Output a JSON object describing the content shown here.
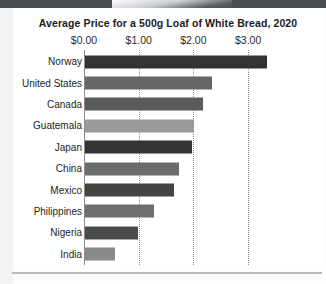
{
  "chart_data": {
    "type": "bar",
    "orientation": "horizontal",
    "title": "Average Price for a 500g Loaf of White Bread, 2020",
    "xlabel": "",
    "ylabel": "",
    "categories": [
      "Norway",
      "United States",
      "Canada",
      "Guatemala",
      "Japan",
      "China",
      "Mexico",
      "Philippines",
      "Nigeria",
      "India"
    ],
    "values": [
      3.33,
      2.33,
      2.16,
      2.0,
      1.95,
      1.71,
      1.62,
      1.27,
      0.97,
      0.55
    ],
    "bar_colors": [
      "#333333",
      "#666666",
      "#5a5a5a",
      "#9a9a9a",
      "#333333",
      "#6b6b6b",
      "#444444",
      "#6e6e6e",
      "#4a4a4a",
      "#8a8a8a"
    ],
    "xlim": [
      0,
      3.6
    ],
    "xticks": [
      0,
      1,
      2,
      3
    ],
    "xtick_labels": [
      "$0.00",
      "$1.00",
      "$2.00",
      "$3.00"
    ],
    "grid": "dotted-vertical",
    "legend": null,
    "tick_label_position": "top"
  },
  "colors": {
    "background": "#ffffff",
    "page_background": "#fdfdfd",
    "top_band": "#4a4d52",
    "gridline": "#8f8f8f",
    "axis": "#8a8a8a",
    "title_text": "#1b1b1b",
    "label_text": "#232323"
  }
}
